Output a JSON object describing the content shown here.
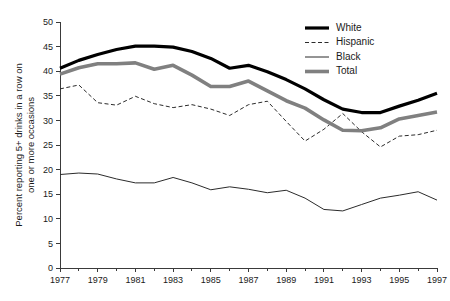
{
  "chart_data": {
    "type": "line",
    "title": "",
    "xlabel": "",
    "ylabel": "Percent reporting 5+ drinks in a row on one or more occasions",
    "ylabel_line1": "Percent reporting 5+ drinks in a row on",
    "ylabel_line2": "one or more occasions",
    "xlim": [
      1977,
      1997
    ],
    "ylim": [
      0,
      50
    ],
    "ytick_step": 5,
    "yticks": [
      0,
      5,
      10,
      15,
      20,
      25,
      30,
      35,
      40,
      45,
      50
    ],
    "xticks": [
      1977,
      1979,
      1981,
      1983,
      1985,
      1987,
      1989,
      1991,
      1993,
      1995,
      1997
    ],
    "xticks_minor": [
      1978,
      1980,
      1982,
      1984,
      1986,
      1988,
      1990,
      1992,
      1994,
      1996
    ],
    "grid": false,
    "legend_position": "top-right",
    "x": [
      1977,
      1978,
      1979,
      1980,
      1981,
      1982,
      1983,
      1984,
      1985,
      1986,
      1987,
      1988,
      1989,
      1990,
      1991,
      1992,
      1993,
      1994,
      1995,
      1996,
      1997
    ],
    "series": [
      {
        "name": "White",
        "style": "thick-solid",
        "color": "#000000",
        "width": 3.2,
        "dash": "",
        "values": [
          40.6,
          42.2,
          43.4,
          44.4,
          45.1,
          45.1,
          44.9,
          44.0,
          42.6,
          40.6,
          41.2,
          39.9,
          38.3,
          36.4,
          34.2,
          32.3,
          31.6,
          31.6,
          32.9,
          34.1,
          35.5
        ]
      },
      {
        "name": "Hispanic",
        "style": "dashed",
        "color": "#2b2b2b",
        "width": 1.0,
        "dash": "4,2.5",
        "values": [
          36.4,
          37.2,
          33.6,
          33.1,
          34.9,
          33.4,
          32.6,
          33.2,
          32.3,
          31.0,
          33.2,
          33.9,
          29.8,
          25.8,
          28.2,
          31.4,
          27.7,
          24.6,
          26.8,
          27.1,
          28.0
        ]
      },
      {
        "name": "Black",
        "style": "thin-solid",
        "color": "#2b2b2b",
        "width": 1.0,
        "dash": "",
        "values": [
          19.0,
          19.3,
          19.1,
          18.1,
          17.3,
          17.3,
          18.4,
          17.3,
          15.9,
          16.5,
          16.0,
          15.3,
          15.8,
          14.2,
          11.9,
          11.6,
          12.9,
          14.2,
          14.8,
          15.5,
          13.8
        ]
      },
      {
        "name": "Total",
        "style": "thick-gray",
        "color": "#808080",
        "width": 3.6,
        "dash": "",
        "values": [
          39.4,
          40.7,
          41.5,
          41.5,
          41.7,
          40.4,
          41.2,
          39.2,
          36.9,
          36.9,
          38.0,
          36.0,
          34.0,
          32.5,
          30.1,
          28.0,
          27.9,
          28.5,
          30.3,
          31.0,
          31.7
        ]
      }
    ]
  },
  "legend": {
    "items": [
      {
        "label": "White"
      },
      {
        "label": "Hispanic"
      },
      {
        "label": "Black"
      },
      {
        "label": "Total"
      }
    ]
  }
}
